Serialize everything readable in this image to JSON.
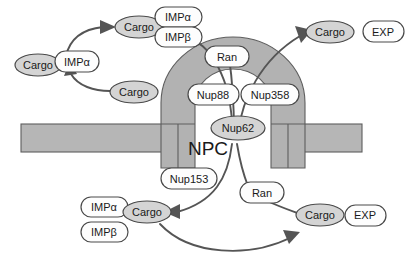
{
  "figure": {
    "width": 411,
    "height": 264,
    "background": "#ffffff"
  },
  "colors": {
    "membrane_fill": "#b6b6b6",
    "npc_fill": "#b2b2b2",
    "cargo_fill": "#d4d4d4",
    "node_fill": "#fdfdfd",
    "outline": "#5e5e5e",
    "arrow": "#555555",
    "text": "#1a1a1a"
  },
  "structure": {
    "npc_label": "NPC",
    "membrane_label": "nuclear-envelope-membrane"
  },
  "nucleoporins": [
    {
      "id": "nup88",
      "label": "Nup88"
    },
    {
      "id": "nup358",
      "label": "Nup358"
    },
    {
      "id": "nup62",
      "label": "Nup62"
    },
    {
      "id": "nup153",
      "label": "Nup153"
    }
  ],
  "cytoplasm_import": {
    "cargo_free": "Cargo",
    "impa_receptor": "IMPα",
    "cargo_loaded": "Cargo",
    "impa_complex": "IMPα",
    "impb_complex": "IMPβ",
    "cargo_recycled": "Cargo"
  },
  "cytoplasm_export": {
    "ran": "Ran",
    "cargo_released": "Cargo",
    "exp_receptor": "EXP"
  },
  "nucleoplasm_import": {
    "impa_free": "IMPα",
    "impb_free": "IMPβ",
    "cargo_delivered": "Cargo"
  },
  "nucleoplasm_export": {
    "ran": "Ran",
    "cargo_loaded": "Cargo",
    "exp_receptor": "EXP"
  },
  "flows": [
    {
      "id": "import-cargo-binding",
      "from": "Cargo",
      "to": "Cargo-IMPα/IMPβ",
      "direction": "upper-right"
    },
    {
      "id": "import-receptor-recycle",
      "from": "Cargo",
      "to": "IMPα",
      "direction": "up"
    },
    {
      "id": "import-complex-to-pore",
      "from": "Cargo-IMPα/IMPβ",
      "to": "Nup62 channel",
      "direction": "down-right"
    },
    {
      "id": "ran-cytoplasmic-to-pore",
      "from": "Ran",
      "to": "Nup62 channel",
      "direction": "down"
    },
    {
      "id": "export-pore-to-cytoplasm",
      "from": "Nup62 channel",
      "to": "Cargo",
      "direction": "up-right"
    },
    {
      "id": "import-pore-to-nucleoplasm",
      "from": "Nup62 channel",
      "to": "Cargo",
      "direction": "down-left"
    },
    {
      "id": "ran-nucleoplasmic-to-pore",
      "from": "Ran",
      "to": "Nup62 channel",
      "direction": "up-left"
    },
    {
      "id": "export-cargo-loading",
      "from": "Cargo",
      "to": "Cargo-EXP",
      "direction": "right"
    },
    {
      "id": "ran-to-export-complex",
      "from": "Ran",
      "to": "Cargo-EXP",
      "direction": "down-right"
    }
  ]
}
